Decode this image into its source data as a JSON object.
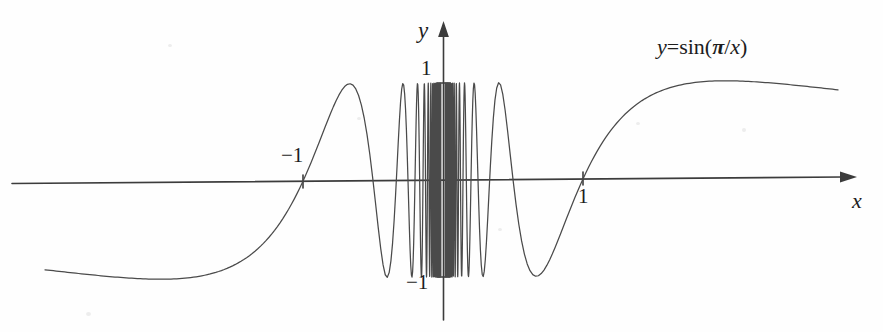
{
  "figure": {
    "background_color": "#fefefe",
    "ink_color": "#3c3c3c",
    "curve_color": "#4a4a4a",
    "axis_labels": {
      "x": "x",
      "y": "y"
    },
    "tick_labels": {
      "y_top": "1",
      "y_bottom": "−1",
      "x_left": "−1",
      "x_right": "1"
    },
    "equation": {
      "lhs": "y",
      "equals": "=",
      "func": "sin(",
      "pi": "π",
      "slash": "/",
      "arg": "x",
      "close": ")",
      "full_text": "y = sin(π/x)"
    }
  },
  "chart_data": {
    "type": "line",
    "title": "",
    "subtitle": "",
    "xlabel": "x",
    "ylabel": "y",
    "function": "y = sin(pi/x)",
    "xlim": [
      -2.85,
      2.75
    ],
    "ylim": [
      -1.55,
      1.65
    ],
    "xticks": [
      -1,
      1
    ],
    "xtick_labels": [
      "−1",
      "1"
    ],
    "yticks": [
      -1,
      1
    ],
    "ytick_labels": [
      "−1",
      "1"
    ],
    "grid": false,
    "legend": false,
    "annotations": [
      {
        "text": "y = sin(π/x)",
        "x": 1.95,
        "y": 1.42
      }
    ],
    "axis_arrows": [
      "x-positive",
      "y-positive"
    ],
    "series": [
      {
        "name": "sin(pi/x)",
        "color": "#4a4a4a",
        "x_domain_left": [
          -2.85,
          -0.02
        ],
        "x_domain_right": [
          0.02,
          2.75
        ],
        "singularity_at": 0,
        "amplitude": 1,
        "description": "Oscillates infinitely often between -1 and 1 as x approaches 0 from either side; approaches 0 slowly for large |x|."
      }
    ],
    "pixel_geometry": {
      "origin_x": 443,
      "origin_y": 180,
      "unit_x_px": 140,
      "unit_y_px": 97,
      "x_axis_left_px": 12,
      "x_axis_right_px": 848,
      "y_axis_top_px": 30,
      "y_axis_bottom_px": 320,
      "curve_left_px": 45,
      "curve_right_px": 838
    }
  }
}
